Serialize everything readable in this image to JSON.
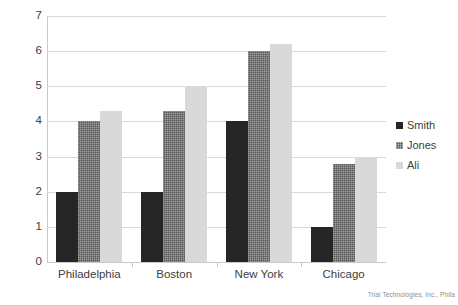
{
  "chart_data": {
    "type": "bar",
    "title": "",
    "subtitle": "",
    "xlabel": "",
    "ylabel": "",
    "categories": [
      "Philadelphia",
      "Boston",
      "New York",
      "Chicago"
    ],
    "series": [
      {
        "name": "Smith",
        "color": "#262626",
        "values": [
          2.0,
          2.0,
          4.0,
          1.0
        ]
      },
      {
        "name": "Jones",
        "color": "#595959",
        "values": [
          4.0,
          4.3,
          6.0,
          2.8
        ]
      },
      {
        "name": "Ali",
        "color": "#d9d9d9",
        "values": [
          4.3,
          5.0,
          6.2,
          3.0
        ]
      }
    ],
    "ylim": [
      0,
      7
    ],
    "yticks": [
      0,
      1,
      2,
      3,
      4,
      5,
      6,
      7
    ],
    "ytick_labels": [
      "0",
      "1",
      "2",
      "3",
      "4",
      "5",
      "6",
      "7"
    ],
    "grid": true,
    "grid_axis": "y",
    "legend_position": "right"
  },
  "legend": {
    "items": [
      {
        "label": "Smith"
      },
      {
        "label": "Jones"
      },
      {
        "label": "Ali"
      }
    ]
  },
  "footer": {
    "attribution": "Trial Technologies, Inc., Phila"
  }
}
